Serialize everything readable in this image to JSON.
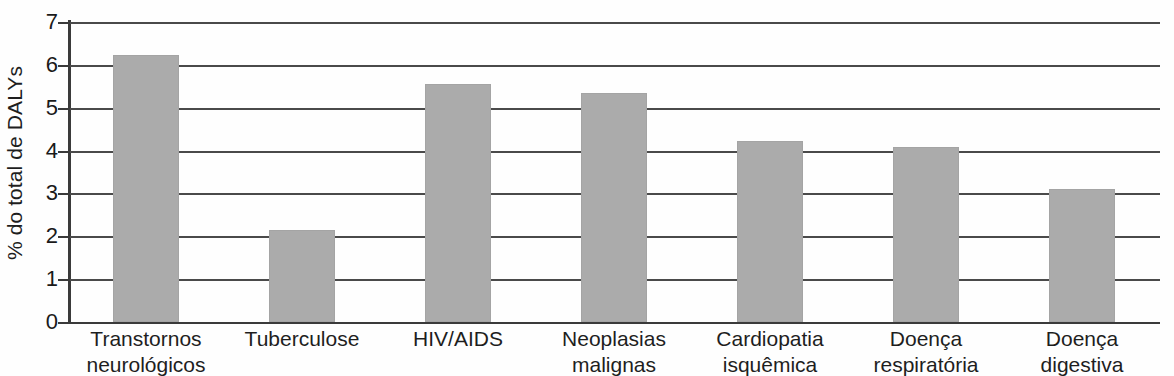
{
  "chart_data": {
    "type": "bar",
    "title": "",
    "xlabel": "",
    "ylabel": "% do total de DALYs",
    "ylim": [
      0,
      7
    ],
    "yticks": [
      "0",
      "1",
      "2",
      "3",
      "4",
      "5",
      "6",
      "7"
    ],
    "grid": true,
    "legend": null,
    "orientation": "vertical",
    "bar_color": "#ababab",
    "categories": [
      "Transtornos neurológicos",
      "Tuberculose",
      "HIV/AIDS",
      "Neoplasias malignas",
      "Cardiopatia isquêmica",
      "Doença respiratória",
      "Doença digestiva"
    ],
    "category_lines": [
      [
        "Transtornos",
        "neurológicos"
      ],
      [
        "Tuberculose",
        ""
      ],
      [
        "HIV/AIDS",
        ""
      ],
      [
        "Neoplasias",
        "malignas"
      ],
      [
        "Cardiopatia",
        "isquêmica"
      ],
      [
        "Doença",
        "respiratória"
      ],
      [
        "Doença",
        "digestiva"
      ]
    ],
    "values": [
      6.22,
      2.15,
      5.55,
      5.35,
      4.22,
      4.08,
      3.1
    ]
  }
}
